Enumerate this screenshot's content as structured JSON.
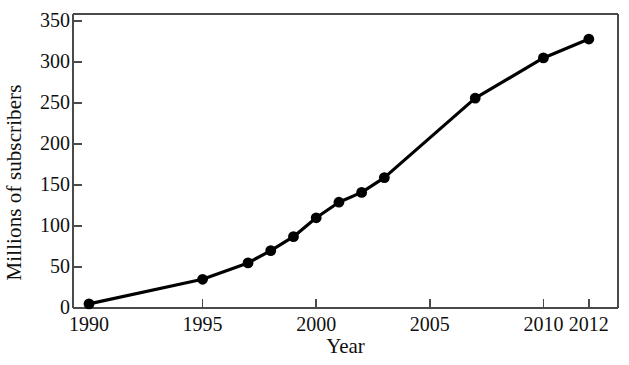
{
  "chart_data": {
    "type": "line",
    "title": "",
    "xlabel": "Year",
    "ylabel": "Millions of subscribers",
    "xlim": [
      1990,
      2012.8
    ],
    "ylim": [
      0,
      365
    ],
    "grid": false,
    "legend": "none",
    "marker": "filled-circle",
    "line_color": "#000000",
    "marker_color": "#000000",
    "axis_color": "#4a4a4a",
    "x": [
      1990,
      1995,
      1997,
      1998,
      1999,
      2000,
      2001,
      2002,
      2003,
      2007,
      2010,
      2012
    ],
    "values": [
      5,
      35,
      55,
      70,
      87,
      110,
      129,
      141,
      159,
      256,
      305,
      328
    ],
    "xticks": [
      1990,
      1995,
      2000,
      2005,
      2010,
      2012
    ],
    "xtick_labels": [
      "1990",
      "1995",
      "2000",
      "2005",
      "2010",
      "2012"
    ],
    "yticks": [
      0,
      50,
      100,
      150,
      200,
      250,
      300,
      350
    ],
    "ytick_labels": [
      "0",
      "50",
      "100",
      "150",
      "200",
      "250",
      "300",
      "350"
    ]
  }
}
